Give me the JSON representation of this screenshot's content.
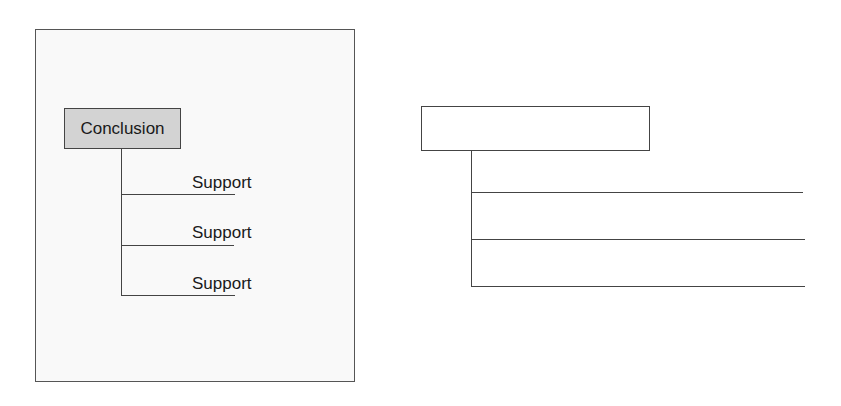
{
  "left_diagram": {
    "conclusion_label": "Conclusion",
    "supports": [
      {
        "label": "Support"
      },
      {
        "label": "Support"
      },
      {
        "label": "Support"
      }
    ],
    "conclusion_fill": "#d3d3d3"
  },
  "right_diagram": {
    "conclusion_label": "",
    "support_lines": 3
  }
}
